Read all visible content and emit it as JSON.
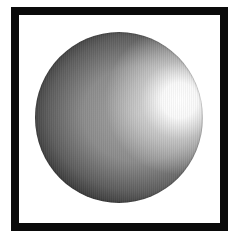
{
  "image": {
    "subject": "shaded sphere",
    "frame": {
      "color": "#0a0a0a",
      "background": "#ffffff"
    },
    "sphere": {
      "base_color": "#8c8c8c",
      "shadow_color": "#3e3e3e",
      "highlight_color": "#ffffff"
    }
  }
}
